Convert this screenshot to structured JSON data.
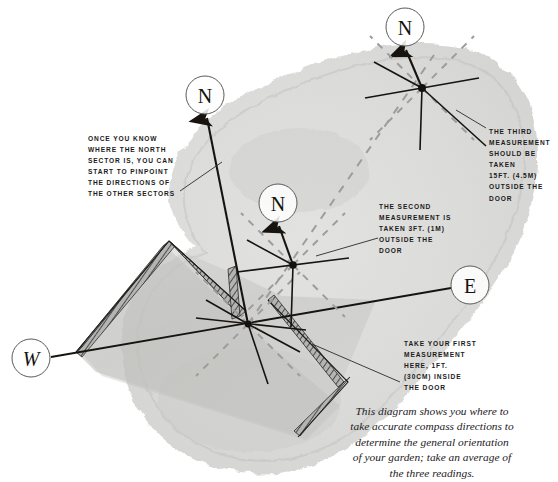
{
  "figure": {
    "kind": "garden-orientation-compass-diagram",
    "palette": {
      "paper": "#ffffff",
      "wash": "#d9d9d7",
      "wash_dark": "#b9b9b7",
      "ink": "#1b1b1b",
      "wall": "#8a8a88",
      "dashed_guide": "#9a9a98",
      "plot_fill": "#c6c6c4"
    }
  },
  "annotations": [
    {
      "id": "note-sectors",
      "text": "Once you know\nwhere the north\nsector is, you can\nstart to pinpoint\nthe directions of\nthe other sectors"
    },
    {
      "id": "note-third-measurement",
      "text": "The third\nmeasurement\nshould be taken\n15ft. (4.5m)\noutside the\ndoor"
    },
    {
      "id": "note-second-measurement",
      "text": "The second\nmeasurement is\ntaken 3ft. (1m)\noutside the\ndoor"
    },
    {
      "id": "note-first-measurement",
      "text": "Take your first\nmeasurement\nhere, 1ft.\n(30cm) inside\nthe door"
    }
  ],
  "caption": {
    "text": "This diagram shows you where to\ntake accurate compass directions to\ndetermine the general orientation\nof your garden; take an average of\nthe three readings."
  },
  "cardinal_markers": [
    {
      "id": "north-top",
      "label": "N",
      "cx": 405,
      "cy": 27,
      "r": 19,
      "italic": false
    },
    {
      "id": "north-left",
      "label": "N",
      "cx": 205,
      "cy": 95,
      "r": 19,
      "italic": false
    },
    {
      "id": "north-center",
      "label": "N",
      "cx": 278,
      "cy": 203,
      "r": 19,
      "italic": false
    },
    {
      "id": "east",
      "label": "E",
      "cx": 470,
      "cy": 285,
      "r": 19,
      "italic": false
    },
    {
      "id": "west",
      "label": "W",
      "cx": 31,
      "cy": 358,
      "r": 19,
      "italic": true
    }
  ],
  "measurement_points": [
    {
      "id": "reading-1-inside-door",
      "order": 1,
      "cx": 248,
      "cy": 324,
      "distance_ft": 1,
      "distance_metric": "30cm",
      "placement": "inside the door"
    },
    {
      "id": "reading-2-outside-door",
      "order": 2,
      "cx": 293,
      "cy": 265,
      "distance_ft": 3,
      "distance_metric": "1m",
      "placement": "outside the door"
    },
    {
      "id": "reading-3-outside-door",
      "order": 3,
      "cx": 422,
      "cy": 88,
      "distance_ft": 15,
      "distance_metric": "4.5m",
      "placement": "outside the door"
    }
  ]
}
